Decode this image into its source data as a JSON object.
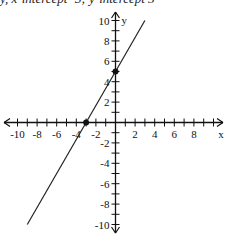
{
  "caption": "y, x-intercept -3; y-intercept 5",
  "chart_data": {
    "type": "line",
    "title": "",
    "xlabel": "x",
    "ylabel": "y",
    "xlim": [
      -10,
      10
    ],
    "ylim": [
      -10,
      10
    ],
    "grid": false,
    "x_ticks": [
      -10,
      -8,
      -6,
      -4,
      -2,
      2,
      4,
      6,
      8
    ],
    "x_tick_labels": [
      "-10",
      "-8",
      "-6",
      "-4",
      "-2",
      "2",
      "4",
      "6",
      "8"
    ],
    "y_ticks": [
      10,
      8,
      6,
      4,
      2,
      -2,
      -4,
      -6,
      -8,
      -10
    ],
    "y_tick_labels": [
      "10",
      "8",
      "6",
      "4",
      "2",
      "-2",
      "-4",
      "-6",
      "-8",
      "-10"
    ],
    "series": [
      {
        "name": "y = (5/3)x + 5",
        "slope": 1.6667,
        "intercept": 5,
        "x": [
          -9,
          3
        ],
        "y": [
          -10,
          10
        ],
        "color": "#222222"
      }
    ],
    "points": [
      {
        "label": "x-intercept",
        "x": -3,
        "y": 0
      },
      {
        "label": "y-intercept",
        "x": 0,
        "y": 5
      }
    ]
  }
}
